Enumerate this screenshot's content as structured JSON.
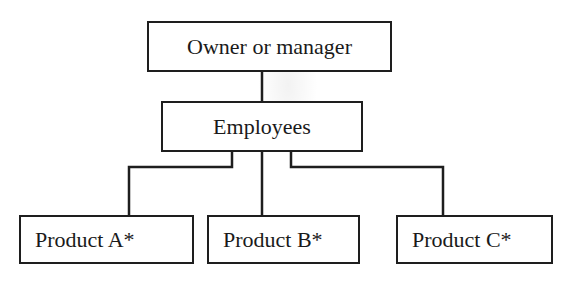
{
  "diagram": {
    "type": "org-chart",
    "nodes": {
      "owner": {
        "label": "Owner or manager"
      },
      "employees": {
        "label": "Employees"
      },
      "products": [
        {
          "label": "Product A*"
        },
        {
          "label": "Product B*"
        },
        {
          "label": "Product C*"
        }
      ]
    },
    "edges": [
      {
        "from": "Owner or manager",
        "to": "Employees"
      },
      {
        "from": "Employees",
        "to": "Product A*"
      },
      {
        "from": "Employees",
        "to": "Product B*"
      },
      {
        "from": "Employees",
        "to": "Product C*"
      }
    ],
    "colors": {
      "stroke": "#1e1e1e",
      "background": "#ffffff",
      "text": "#1a1a1a"
    }
  }
}
